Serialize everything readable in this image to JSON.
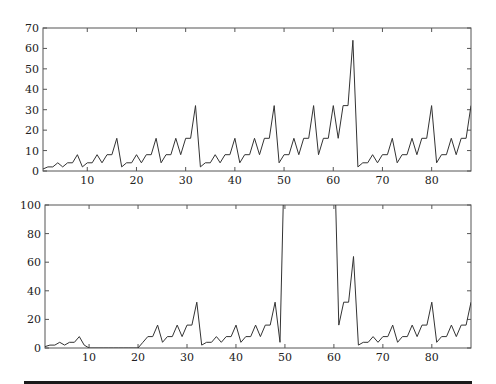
{
  "chart_data": [
    {
      "type": "line",
      "title": "",
      "xlabel": "",
      "ylabel": "",
      "xlim": [
        1,
        88
      ],
      "ylim": [
        0,
        70
      ],
      "xticks": [
        10,
        20,
        30,
        40,
        50,
        60,
        70,
        80
      ],
      "yticks": [
        0,
        10,
        20,
        30,
        40,
        50,
        60,
        70
      ],
      "grid": false,
      "legend": null,
      "line_color": "#333333",
      "x": [
        1,
        2,
        3,
        4,
        5,
        6,
        7,
        8,
        9,
        10,
        11,
        12,
        13,
        14,
        15,
        16,
        17,
        18,
        19,
        20,
        21,
        22,
        23,
        24,
        25,
        26,
        27,
        28,
        29,
        30,
        31,
        32,
        33,
        34,
        35,
        36,
        37,
        38,
        39,
        40,
        41,
        42,
        43,
        44,
        45,
        46,
        47,
        48,
        49,
        50,
        51,
        52,
        53,
        54,
        55,
        56,
        57,
        58,
        59,
        60,
        61,
        62,
        63,
        64,
        65,
        66,
        67,
        68,
        69,
        70,
        71,
        72,
        73,
        74,
        75,
        76,
        77,
        78,
        79,
        80,
        81,
        82,
        83,
        84,
        85,
        86,
        87,
        88
      ],
      "values": [
        1,
        2,
        2,
        4,
        2,
        4,
        4,
        8,
        2,
        4,
        4,
        8,
        4,
        8,
        8,
        16,
        2,
        4,
        4,
        8,
        4,
        8,
        8,
        16,
        4,
        8,
        8,
        16,
        8,
        16,
        16,
        32,
        2,
        4,
        4,
        8,
        4,
        8,
        8,
        16,
        4,
        8,
        8,
        16,
        8,
        16,
        16,
        32,
        4,
        8,
        8,
        16,
        8,
        16,
        16,
        32,
        8,
        16,
        16,
        32,
        16,
        32,
        32,
        64,
        2,
        4,
        4,
        8,
        4,
        8,
        8,
        16,
        4,
        8,
        8,
        16,
        8,
        16,
        16,
        32,
        4,
        8,
        8,
        16,
        8,
        16,
        16,
        32
      ]
    },
    {
      "type": "line",
      "title": "",
      "xlabel": "",
      "ylabel": "",
      "xlim": [
        1,
        88
      ],
      "ylim": [
        0,
        100
      ],
      "xticks": [
        10,
        20,
        30,
        40,
        50,
        60,
        70,
        80
      ],
      "yticks": [
        0,
        20,
        40,
        60,
        80,
        100
      ],
      "grid": false,
      "legend": null,
      "line_color": "#333333",
      "annotation": "values at x=50..60 exceed the y-axis limit and are clipped",
      "x": [
        1,
        2,
        3,
        4,
        5,
        6,
        7,
        8,
        9,
        10,
        11,
        12,
        13,
        14,
        15,
        16,
        17,
        18,
        19,
        20,
        21,
        22,
        23,
        24,
        25,
        26,
        27,
        28,
        29,
        30,
        31,
        32,
        33,
        34,
        35,
        36,
        37,
        38,
        39,
        40,
        41,
        42,
        43,
        44,
        45,
        46,
        47,
        48,
        49,
        50,
        51,
        52,
        53,
        54,
        55,
        56,
        57,
        58,
        59,
        60,
        61,
        62,
        63,
        64,
        65,
        66,
        67,
        68,
        69,
        70,
        71,
        72,
        73,
        74,
        75,
        76,
        77,
        78,
        79,
        80,
        81,
        82,
        83,
        84,
        85,
        86,
        87,
        88
      ],
      "values": [
        1,
        2,
        2,
        4,
        2,
        4,
        4,
        8,
        2,
        0,
        0,
        0,
        0,
        0,
        0,
        0,
        0,
        0,
        0,
        0,
        4,
        8,
        8,
        16,
        4,
        8,
        8,
        16,
        8,
        16,
        16,
        32,
        2,
        4,
        4,
        8,
        4,
        8,
        8,
        16,
        4,
        8,
        8,
        16,
        8,
        16,
        16,
        32,
        4,
        150,
        150,
        150,
        150,
        150,
        150,
        150,
        150,
        150,
        150,
        150,
        16,
        32,
        32,
        64,
        2,
        4,
        4,
        8,
        4,
        8,
        8,
        16,
        4,
        8,
        8,
        16,
        8,
        16,
        16,
        32,
        4,
        8,
        8,
        16,
        8,
        16,
        16,
        32
      ]
    }
  ]
}
